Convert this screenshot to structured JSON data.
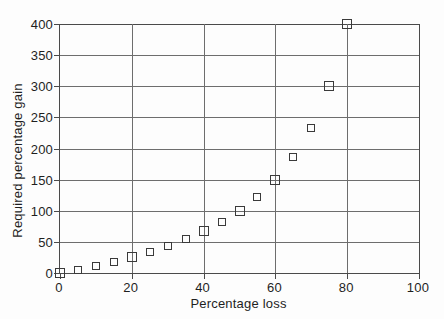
{
  "chart_data": {
    "type": "scatter",
    "title": "",
    "xlabel": "Percentage loss",
    "ylabel": "Required percentage gain",
    "xlim": [
      0,
      100
    ],
    "ylim": [
      0,
      400
    ],
    "grid": true,
    "legend": "none",
    "marker": "open-square",
    "x_ticks": [
      0,
      20,
      40,
      60,
      80,
      100
    ],
    "x_tick_labels": [
      "0",
      "20",
      "40",
      "60",
      "80",
      "100"
    ],
    "y_ticks": [
      0,
      50,
      100,
      150,
      200,
      250,
      300,
      350,
      400
    ],
    "y_tick_labels": [
      "0",
      "50",
      "100",
      "150",
      "200",
      "250",
      "300",
      "350",
      "400"
    ],
    "x": [
      0,
      5,
      10,
      15,
      20,
      25,
      30,
      35,
      40,
      45,
      50,
      55,
      60,
      65,
      70,
      75,
      80
    ],
    "y": [
      0,
      5,
      11,
      18,
      25,
      33,
      43,
      54,
      67,
      82,
      100,
      122,
      150,
      186,
      233,
      300,
      400
    ],
    "points": [
      {
        "x": 0,
        "y": 0
      },
      {
        "x": 5,
        "y": 5
      },
      {
        "x": 10,
        "y": 11
      },
      {
        "x": 15,
        "y": 18
      },
      {
        "x": 20,
        "y": 25
      },
      {
        "x": 25,
        "y": 33
      },
      {
        "x": 30,
        "y": 43
      },
      {
        "x": 35,
        "y": 54
      },
      {
        "x": 40,
        "y": 67
      },
      {
        "x": 45,
        "y": 82
      },
      {
        "x": 50,
        "y": 100
      },
      {
        "x": 55,
        "y": 122
      },
      {
        "x": 60,
        "y": 150
      },
      {
        "x": 65,
        "y": 186
      },
      {
        "x": 70,
        "y": 233
      },
      {
        "x": 75,
        "y": 300
      },
      {
        "x": 80,
        "y": 400
      }
    ]
  },
  "colors": {
    "background": "#fdfdfd",
    "axis": "#4a4a4a",
    "grid": "#6d6d6d",
    "marker_stroke": "#3a3a3a",
    "text": "#1f1f1f"
  }
}
